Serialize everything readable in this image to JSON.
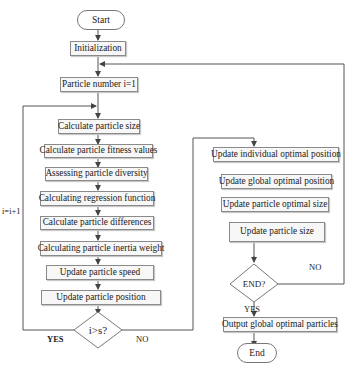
{
  "diagram": {
    "type": "flowchart",
    "terminals": {
      "start": "Start",
      "end": "End"
    },
    "nodes": {
      "init": "Initialization",
      "particle_number": "Particle number i=1",
      "calc_size": "Calculate particle size",
      "calc_fitness": "Calculate particle fitness values",
      "assess_diversity": "Assessing particle diversity",
      "calc_regression": "Calculating regression function",
      "calc_differences": "Calculate particle differences",
      "calc_inertia": "Calculating particle inertia weight",
      "update_speed": "Update particle speed",
      "update_position": "Update particle position",
      "update_individual": "Update individual optimal position",
      "update_global": "Update global optimal position",
      "update_optimal_size": "Update particle optimal size",
      "update_size": "Update particle size",
      "output_global": "Output global optimal particles"
    },
    "decisions": {
      "i_gt_s": "i>s?",
      "end_check": "END?"
    },
    "edge_labels": {
      "loop_increment": "i=i+1",
      "i_gt_s_yes": "YES",
      "i_gt_s_no": "NO",
      "end_no": "NO",
      "end_yes": "YES"
    }
  }
}
